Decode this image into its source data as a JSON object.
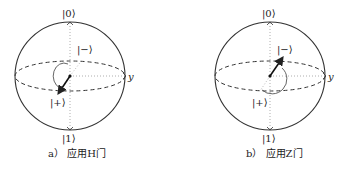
{
  "figures": [
    {
      "id": "a",
      "caption": "a） 应用H门",
      "labels": {
        "top": "|0⟩",
        "bottom": "|1⟩",
        "minus": "|−⟩",
        "plus": "|+⟩",
        "y_axis": "y"
      },
      "state_vector": "|+⟩ → |−⟩ via H gate rotation"
    },
    {
      "id": "b",
      "caption": "b） 应用Z门",
      "labels": {
        "top": "|0⟩",
        "bottom": "|1⟩",
        "minus": "|−⟩",
        "plus": "|+⟩",
        "y_axis": "y"
      },
      "state_vector": "|+⟩ → |−⟩ via Z gate rotation"
    }
  ]
}
